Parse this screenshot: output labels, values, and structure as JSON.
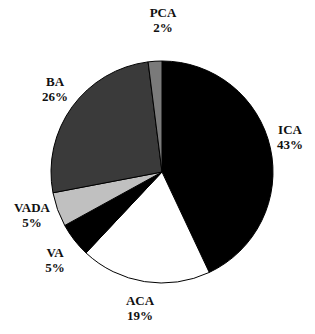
{
  "chart_data": {
    "type": "pie",
    "title": "",
    "slices": [
      {
        "label": "ICA",
        "value": 43,
        "display": "43%",
        "color": "#000000"
      },
      {
        "label": "ACA",
        "value": 19,
        "display": "19%",
        "color": "#ffffff"
      },
      {
        "label": "VA",
        "value": 5,
        "display": "5%",
        "color": "#000000"
      },
      {
        "label": "VADA",
        "value": 5,
        "display": "5%",
        "color": "#c0c0c0"
      },
      {
        "label": "BA",
        "value": 26,
        "display": "26%",
        "color": "#3a3a3a"
      },
      {
        "label": "PCA",
        "value": 2,
        "display": "2%",
        "color": "#7a7a7a"
      }
    ],
    "start_angle_deg": 0,
    "direction": "clockwise",
    "legend": "none (labels outside slices)"
  },
  "labels": {
    "ica": {
      "name": "ICA",
      "pct": "43%"
    },
    "aca": {
      "name": "ACA",
      "pct": "19%"
    },
    "va": {
      "name": "VA",
      "pct": "5%"
    },
    "vada": {
      "name": "VADA",
      "pct": "5%"
    },
    "ba": {
      "name": "BA",
      "pct": "26%"
    },
    "pca": {
      "name": "PCA",
      "pct": "2%"
    }
  }
}
